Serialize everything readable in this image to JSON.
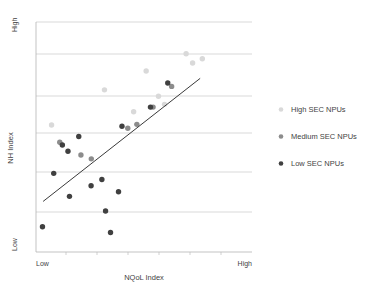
{
  "chart_data": {
    "type": "scatter",
    "title": "",
    "xlabel": "NQoL Index",
    "ylabel": "NH Index",
    "x_tick_labels": [
      "Low",
      "High"
    ],
    "y_tick_labels": [
      "High",
      "Low"
    ],
    "xlim": [
      0,
      10
    ],
    "ylim": [
      0,
      10
    ],
    "grid": true,
    "gridlines_y": [
      10,
      8.33,
      6.67,
      5.0,
      3.33,
      1.67
    ],
    "legend_position": "right",
    "colors": {
      "high_sec": "#d9d9d9",
      "medium_sec": "#8c8c8c",
      "low_sec": "#404040",
      "trendline": "#3a3a3a",
      "gridline": "#c8c8c8",
      "axis": "#b4b4b4",
      "text": "#3f3f3f"
    },
    "trendline": {
      "label": "linear trend",
      "x0": 0.33,
      "y0": 2.2,
      "x1": 7.6,
      "y1": 7.55
    },
    "series": [
      {
        "name": "High SEC NPUs",
        "marker": "circle",
        "color": "#d9d9d9",
        "points": [
          {
            "x": 0.72,
            "y": 5.52
          },
          {
            "x": 3.17,
            "y": 7.05
          },
          {
            "x": 5.1,
            "y": 7.87
          },
          {
            "x": 5.67,
            "y": 6.77
          },
          {
            "x": 5.95,
            "y": 6.42
          },
          {
            "x": 6.95,
            "y": 8.62
          },
          {
            "x": 7.25,
            "y": 8.22
          },
          {
            "x": 7.7,
            "y": 8.4
          },
          {
            "x": 4.52,
            "y": 6.1
          }
        ]
      },
      {
        "name": "Medium SEC NPUs",
        "marker": "circle",
        "color": "#8c8c8c",
        "points": [
          {
            "x": 1.1,
            "y": 4.77
          },
          {
            "x": 2.08,
            "y": 4.22
          },
          {
            "x": 2.56,
            "y": 4.05
          },
          {
            "x": 4.25,
            "y": 5.38
          },
          {
            "x": 4.67,
            "y": 5.55
          },
          {
            "x": 5.42,
            "y": 6.3
          },
          {
            "x": 6.28,
            "y": 7.2
          }
        ]
      },
      {
        "name": "Low SEC NPUs",
        "marker": "circle",
        "color": "#404040",
        "points": [
          {
            "x": 0.3,
            "y": 1.1
          },
          {
            "x": 0.82,
            "y": 3.42
          },
          {
            "x": 1.22,
            "y": 4.65
          },
          {
            "x": 1.48,
            "y": 4.38
          },
          {
            "x": 1.55,
            "y": 2.42
          },
          {
            "x": 1.98,
            "y": 5.02
          },
          {
            "x": 2.55,
            "y": 2.88
          },
          {
            "x": 3.05,
            "y": 3.15
          },
          {
            "x": 3.22,
            "y": 1.78
          },
          {
            "x": 3.45,
            "y": 0.85
          },
          {
            "x": 3.82,
            "y": 2.62
          },
          {
            "x": 3.98,
            "y": 5.47
          },
          {
            "x": 5.3,
            "y": 6.3
          },
          {
            "x": 6.1,
            "y": 7.35
          }
        ]
      }
    ]
  },
  "legend": {
    "items": [
      {
        "label": "High SEC NPUs",
        "color": "#d9d9d9"
      },
      {
        "label": "Medium SEC NPUs",
        "color": "#8c8c8c"
      },
      {
        "label": "Low SEC NPUs",
        "color": "#404040"
      }
    ]
  },
  "axes": {
    "x_title": "NQoL Index",
    "y_title": "NH Index",
    "x_low": "Low",
    "x_high": "High",
    "y_low": "Low",
    "y_high": "High"
  }
}
